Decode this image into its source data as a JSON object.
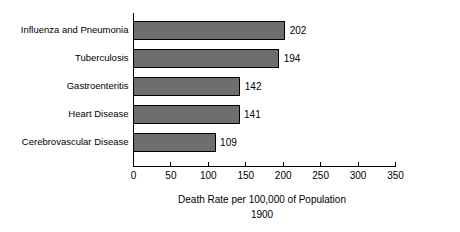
{
  "chart_data": {
    "type": "bar",
    "orientation": "horizontal",
    "title": "",
    "xlabel": "Death Rate per 100,000 of Population",
    "sublabel": "1900",
    "ylabel": "",
    "categories": [
      "Influenza and Pneumonia",
      "Tuberculosis",
      "Gastroenteritis",
      "Heart Disease",
      "Cerebrovascular Disease"
    ],
    "values": [
      202,
      194,
      142,
      141,
      109
    ],
    "value_labels": [
      "202",
      "194",
      "142",
      "141",
      "109"
    ],
    "xlim": [
      0,
      350
    ],
    "xticks": [
      0,
      50,
      100,
      150,
      200,
      250,
      300,
      350
    ],
    "xtick_labels": [
      "0",
      "50",
      "100",
      "150",
      "200",
      "250",
      "300",
      "350"
    ],
    "grid": false,
    "legend": false,
    "bar_color": "#6e6e6e",
    "bar_border_color": "#000000",
    "axis_color": "#000000",
    "text_color": "#000000",
    "background_color": "#ffffff"
  }
}
